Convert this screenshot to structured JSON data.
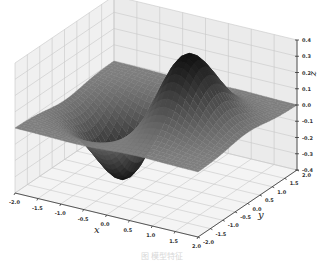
{
  "chart_data": {
    "type": "surface3d",
    "title": "",
    "function": "z = x * exp(-x^2 - y^2)",
    "xlabel": "x",
    "ylabel": "y",
    "zlabel": "z",
    "xlim": [
      -2.0,
      2.0
    ],
    "ylim": [
      -2.0,
      2.0
    ],
    "zlim": [
      -0.4,
      0.4
    ],
    "x_ticks": [
      "-2.0",
      "-1.5",
      "-1.0",
      "-0.5",
      "0.0",
      "0.5",
      "1.0",
      "1.5",
      "2.0"
    ],
    "y_ticks": [
      "-2.0",
      "-1.5",
      "-1.0",
      "-0.5",
      "0.0",
      "0.5",
      "1.0",
      "1.5",
      "2.0"
    ],
    "z_ticks": [
      "-0.4",
      "-0.3",
      "-0.2",
      "-0.1",
      "0.0",
      "0.1",
      "0.2",
      "0.3",
      "0.4"
    ],
    "z_max": 0.43,
    "z_min": -0.43,
    "grid": true,
    "colormap": "gray",
    "legend": null
  },
  "caption": "图 模型特征"
}
